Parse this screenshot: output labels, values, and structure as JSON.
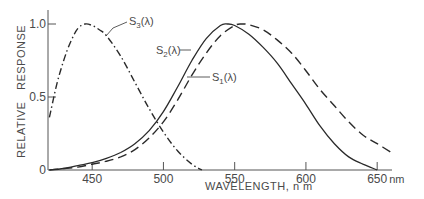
{
  "chart_data": {
    "type": "line",
    "title": "",
    "xlabel": "WAVELENGTH, n m",
    "ylabel": "RELATIVE RESPONSE",
    "x_unit": "nm",
    "xlim": [
      419,
      665
    ],
    "ylim": [
      0,
      1.1
    ],
    "x_ticks": [
      450,
      500,
      550,
      600,
      650
    ],
    "x_tick_labels": [
      "450",
      "500",
      "550",
      "600",
      "650"
    ],
    "y_ticks": [
      0,
      0.5,
      1.0
    ],
    "y_tick_labels": [
      "0",
      "0.5",
      "1.0"
    ],
    "grid": false,
    "legend": "inline annotations with leader lines",
    "series": [
      {
        "name": "S3(λ)",
        "label_main": "S",
        "label_sub": "3",
        "label_suffix": "(λ)",
        "style": "dash-dot",
        "color": "#2a2a2a",
        "x": [
          420,
          425,
          430,
          435,
          440,
          445,
          450,
          455,
          460,
          470,
          480,
          490,
          500,
          510,
          520,
          527
        ],
        "values": [
          0.36,
          0.58,
          0.75,
          0.88,
          0.97,
          1.0,
          0.99,
          0.96,
          0.92,
          0.78,
          0.6,
          0.42,
          0.26,
          0.13,
          0.04,
          0.0
        ]
      },
      {
        "name": "S2(λ)",
        "label_main": "S",
        "label_sub": "2",
        "label_suffix": "(λ)",
        "style": "solid",
        "color": "#2a2a2a",
        "x": [
          420,
          430,
          440,
          450,
          460,
          470,
          480,
          490,
          500,
          510,
          520,
          530,
          540,
          545,
          550,
          560,
          570,
          580,
          590,
          600,
          610,
          620,
          630,
          640,
          650
        ],
        "values": [
          0.0,
          0.01,
          0.03,
          0.05,
          0.08,
          0.12,
          0.18,
          0.27,
          0.4,
          0.57,
          0.75,
          0.9,
          0.99,
          1.0,
          0.99,
          0.93,
          0.84,
          0.73,
          0.59,
          0.45,
          0.3,
          0.18,
          0.09,
          0.04,
          0.0
        ]
      },
      {
        "name": "S1(λ)",
        "label_main": "S",
        "label_sub": "1",
        "label_suffix": "(λ)",
        "style": "dashed",
        "color": "#2a2a2a",
        "x": [
          420,
          430,
          440,
          450,
          460,
          470,
          480,
          490,
          500,
          510,
          520,
          530,
          540,
          550,
          555,
          560,
          570,
          580,
          590,
          600,
          610,
          620,
          630,
          640,
          650,
          660
        ],
        "values": [
          0.0,
          0.01,
          0.02,
          0.04,
          0.06,
          0.09,
          0.14,
          0.22,
          0.33,
          0.48,
          0.65,
          0.8,
          0.92,
          0.99,
          1.0,
          0.995,
          0.96,
          0.89,
          0.8,
          0.68,
          0.55,
          0.44,
          0.33,
          0.24,
          0.18,
          0.12
        ]
      }
    ]
  },
  "axis": {
    "y_title_1": "RELATIVE",
    "y_title_2": "RESPONSE",
    "x_title": "WAVELENGTH, n m",
    "x_unit_suffix": "nm"
  }
}
